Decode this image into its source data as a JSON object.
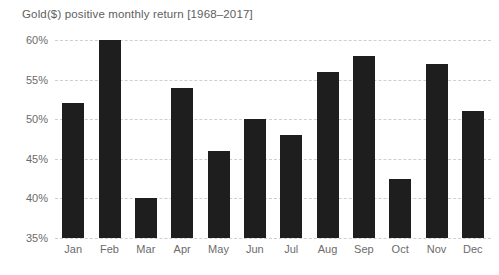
{
  "chart_data": {
    "type": "bar",
    "title": "Gold($) positive monthly return [1968–2017]",
    "xlabel": "",
    "ylabel": "",
    "categories": [
      "Jan",
      "Feb",
      "Mar",
      "Apr",
      "May",
      "Jun",
      "Jul",
      "Aug",
      "Sep",
      "Oct",
      "Nov",
      "Dec"
    ],
    "values": [
      52,
      60,
      40,
      54,
      46,
      50,
      48,
      56,
      58,
      42.5,
      57,
      51
    ],
    "value_suffix": "%",
    "ylim": [
      35,
      60
    ],
    "yticks": [
      35,
      40,
      45,
      50,
      55,
      60
    ],
    "ytick_labels": [
      "35%",
      "40%",
      "45%",
      "50%",
      "55%",
      "60%"
    ],
    "grid": true,
    "grid_axis": "y",
    "grid_style": "dashed",
    "legend": false,
    "series": [
      {
        "name": "Gold($) positive monthly return",
        "values": [
          52,
          60,
          40,
          54,
          46,
          50,
          48,
          56,
          58,
          42.5,
          57,
          51
        ]
      }
    ]
  },
  "colors": {
    "bar": "#1e1e1e",
    "grid": "#cfcfcf",
    "title_text": "#5e5e5e",
    "tick_text": "#6b6b6b",
    "background": "#ffffff"
  }
}
